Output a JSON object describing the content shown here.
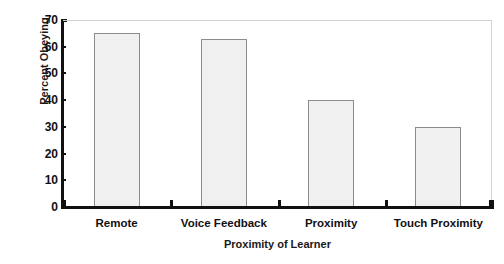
{
  "chart_data": {
    "type": "bar",
    "title": "",
    "subtitle": "",
    "categories": [
      "Remote",
      "Voice Feedback",
      "Proximity",
      "Touch Proximity"
    ],
    "values": [
      65,
      63,
      40,
      30
    ],
    "xlabel": "Proximity of Learner",
    "ylabel": "Percent Obeying",
    "ylim": [
      0,
      70
    ],
    "ytick_values": [
      0,
      10,
      20,
      30,
      40,
      50,
      60,
      70
    ],
    "ytick_labels": [
      "0",
      "10",
      "20",
      "30",
      "40",
      "50",
      "60",
      "70"
    ],
    "grid": false,
    "legend": null,
    "legend_position": "none",
    "annotations": [],
    "colors": {
      "bar_fill": "#f0f0f0",
      "bar_border": "#8c8c8c",
      "axis": "#111111",
      "frame": "#d2d2d2",
      "text": "#111111",
      "background": "#ffffff"
    }
  }
}
